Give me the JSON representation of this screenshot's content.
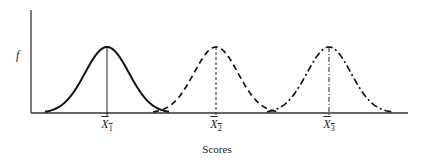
{
  "chart_data": {
    "type": "line",
    "title": "",
    "xlabel": "Scores",
    "ylabel": "f",
    "grid": false,
    "legend": null,
    "series": [
      {
        "name": "Distribution 1",
        "mean_label": "X̄1",
        "line_style": "solid",
        "center_px": 107
      },
      {
        "name": "Distribution 2",
        "mean_label": "X̄2",
        "line_style": "dashed",
        "center_px": 216
      },
      {
        "name": "Distribution 3",
        "mean_label": "X̄3",
        "line_style": "dash-dot",
        "center_px": 329
      }
    ],
    "x_tick_labels": [
      "X̄1",
      "X̄2",
      "X̄3"
    ]
  },
  "labels": {
    "y_axis": "f",
    "x_axis": "Scores",
    "ticks": [
      {
        "base": "X",
        "sub": "1"
      },
      {
        "base": "X",
        "sub": "2"
      },
      {
        "base": "X",
        "sub": "3"
      }
    ]
  }
}
